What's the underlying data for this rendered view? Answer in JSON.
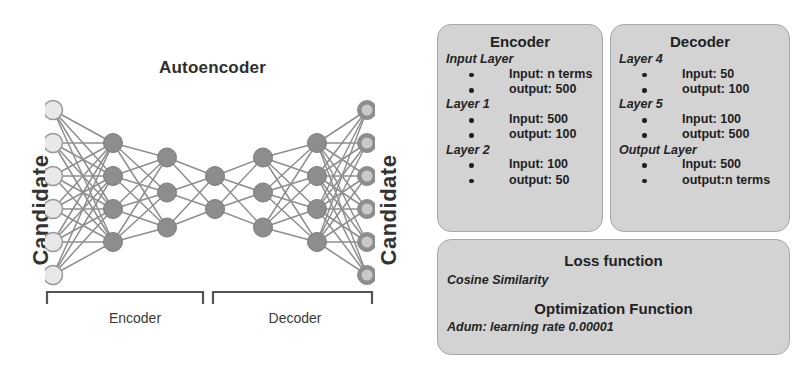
{
  "diagram": {
    "title": "Autoencoder",
    "input_axis_label": "Candidate",
    "output_axis_label": "Candidate",
    "bracket_labels": {
      "encoder": "Encoder",
      "decoder": "Decoder"
    },
    "layer_node_counts": [
      6,
      4,
      3,
      2,
      3,
      4,
      6
    ],
    "colors": {
      "input_node_fill": "#e8e8e8",
      "input_node_stroke": "#9a9a9a",
      "hidden_node_fill": "#8d8d8d",
      "hidden_node_stroke": "#7c7c7c",
      "output_node_ring": "#8d8d8d",
      "output_node_center": "#c9c9c9",
      "edge": "#8e8e8e",
      "bracket": "#555555"
    }
  },
  "encoder_box": {
    "title": "Encoder",
    "groups": [
      {
        "name": "Input Layer",
        "items": [
          "Input: n terms",
          "output: 500"
        ]
      },
      {
        "name": "Layer 1",
        "items": [
          "Input: 500",
          "output: 100"
        ]
      },
      {
        "name": "Layer 2",
        "items": [
          "Input: 100",
          "output: 50"
        ]
      }
    ]
  },
  "decoder_box": {
    "title": "Decoder",
    "groups": [
      {
        "name": "Layer 4",
        "items": [
          "Input: 50",
          "output: 100"
        ]
      },
      {
        "name": "Layer 5",
        "items": [
          "Input: 100",
          "output: 500"
        ]
      },
      {
        "name": "Output Layer",
        "items": [
          "Input: 500",
          "output:n terms"
        ]
      }
    ]
  },
  "functions_box": {
    "loss_title": "Loss function",
    "loss_value": "Cosine Similarity",
    "optimizer_title": "Optimization Function",
    "optimizer_value": "Adum: learning rate 0.00001"
  },
  "style": {
    "box_background": "#d3d3d3",
    "box_border": "#a8a8a8",
    "page_background": "#ffffff"
  }
}
